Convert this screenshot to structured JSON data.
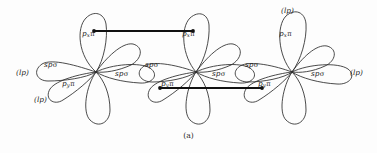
{
  "figure": {
    "caption": "(a)",
    "background_color": "#fdfdfd",
    "stroke_color": "#2a2a2a",
    "bond_color": "#111111"
  },
  "atoms": [
    {
      "id": "left-atom",
      "center": {
        "x": 96,
        "y": 72
      },
      "orbitals": [
        {
          "name": "p-x-pi-up",
          "symbol": "p",
          "sub": "x",
          "greek": "π",
          "label": "pₓπ"
        },
        {
          "name": "sp-sigma-left",
          "symbol": "sp",
          "greek": "σ",
          "label": "spσ"
        },
        {
          "name": "p-y-pi",
          "symbol": "p",
          "sub": "y",
          "greek": "π",
          "label": "pᵧπ"
        },
        {
          "name": "sp-sigma-right",
          "symbol": "sp",
          "greek": "σ",
          "label": "spσ"
        }
      ],
      "lone_pairs": [
        "(lp)",
        "(lp)"
      ]
    },
    {
      "id": "middle-atom",
      "center": {
        "x": 196,
        "y": 72
      },
      "orbitals": [
        {
          "name": "p-x-pi-up",
          "symbol": "p",
          "sub": "x",
          "greek": "π",
          "label": "pₓπ"
        },
        {
          "name": "sp-sigma-left",
          "symbol": "sp",
          "greek": "σ",
          "label": "spσ"
        },
        {
          "name": "p-y-pi",
          "symbol": "p",
          "sub": "y",
          "greek": "π",
          "label": "pᵧπ"
        },
        {
          "name": "sp-sigma-right",
          "symbol": "sp",
          "greek": "σ",
          "label": "spσ"
        }
      ],
      "lone_pairs": []
    },
    {
      "id": "right-atom",
      "center": {
        "x": 292,
        "y": 72
      },
      "orbitals": [
        {
          "name": "p-x-pi-up",
          "symbol": "p",
          "sub": "x",
          "greek": "π",
          "label": "pₓπ"
        },
        {
          "name": "sp-sigma-left",
          "symbol": "sp",
          "greek": "σ",
          "label": "spσ"
        },
        {
          "name": "p-y-pi",
          "symbol": "p",
          "sub": "y",
          "greek": "π",
          "label": "pᵧπ"
        },
        {
          "name": "sp-sigma-right",
          "symbol": "sp",
          "greek": "σ",
          "label": "spσ"
        }
      ],
      "lone_pairs": [
        "(lp)",
        "(lp)"
      ]
    }
  ],
  "labels": {
    "px_pi_left": {
      "base": "p",
      "sub": "x",
      "pi": "π"
    },
    "px_pi_middle": {
      "base": "p",
      "sub": "x",
      "pi": "π"
    },
    "px_pi_right": {
      "base": "p",
      "sub": "x",
      "pi": "π"
    },
    "py_pi_left": {
      "base": "p",
      "sub": "y",
      "pi": "π"
    },
    "py_pi_middle": {
      "base": "p",
      "sub": "y",
      "pi": "π"
    },
    "py_pi_right": {
      "base": "p",
      "sub": "y",
      "pi": "π"
    },
    "sp_sigma_1": {
      "base": "sp",
      "sigma": "σ"
    },
    "sp_sigma_2": {
      "base": "sp",
      "sigma": "σ"
    },
    "sp_sigma_3": {
      "base": "sp",
      "sigma": "σ"
    },
    "sp_sigma_4": {
      "base": "sp",
      "sigma": "σ"
    },
    "sp_sigma_5": {
      "base": "sp",
      "sigma": "σ"
    },
    "sp_sigma_6": {
      "base": "sp",
      "sigma": "σ"
    },
    "lp_far_left": "(lp)",
    "lp_lower_left": "(lp)",
    "lp_top_right": "(lp)",
    "lp_far_right": "(lp)"
  },
  "bonds": [
    {
      "name": "pi-bond-upper",
      "type": "pi",
      "from": "left-atom-px-pi",
      "to": "middle-atom-px-pi",
      "x1": 94,
      "y1": 31,
      "x2": 193,
      "y2": 31
    },
    {
      "name": "pi-bond-lower",
      "type": "pi",
      "from": "middle-atom-py-pi",
      "to": "right-atom-py-pi",
      "x1": 160,
      "y1": 88,
      "x2": 262,
      "y2": 88
    }
  ]
}
